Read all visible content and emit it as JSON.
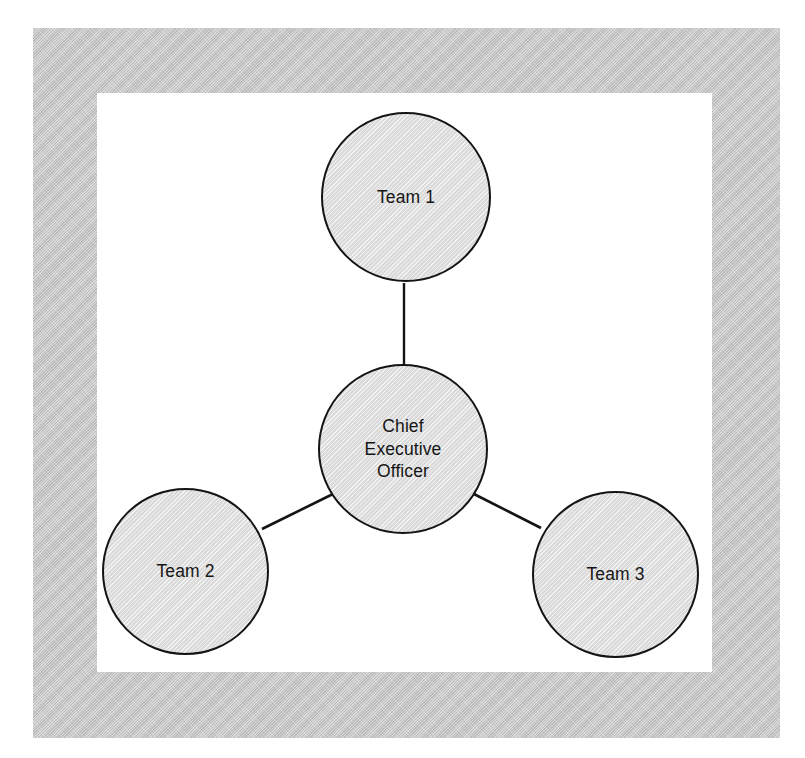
{
  "document": {
    "title": "Organizational Chart",
    "type": "hub-and-spoke org diagram"
  },
  "colors": {
    "frame_gray": "#c9c9c9",
    "plate_white": "#ffffff",
    "node_fill": "#e2e2e2",
    "node_stroke": "#141414",
    "connector_stroke": "#141414",
    "text": "#161616"
  },
  "diagram": {
    "nodes": [
      {
        "id": "ceo",
        "label": "Chief\nExecutive\nOfficer",
        "role": "center",
        "cx": 403,
        "cy": 449,
        "r": 85
      },
      {
        "id": "team1",
        "label": "Team 1",
        "role": "spoke",
        "cx": 406,
        "cy": 197,
        "r": 85
      },
      {
        "id": "team2",
        "label": "Team 2",
        "role": "spoke",
        "cx": 185,
        "cy": 571,
        "r": 83
      },
      {
        "id": "team3",
        "label": "Team 3",
        "role": "spoke",
        "cx": 615,
        "cy": 574,
        "r": 83
      }
    ],
    "edges": [
      {
        "id": "ceo-team1",
        "from": "ceo",
        "to": "team1"
      },
      {
        "id": "ceo-team2",
        "from": "ceo",
        "to": "team2"
      },
      {
        "id": "ceo-team3",
        "from": "ceo",
        "to": "team3"
      }
    ]
  }
}
